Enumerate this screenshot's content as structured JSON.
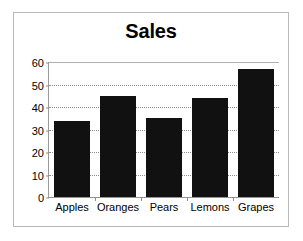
{
  "chart_data": {
    "type": "bar",
    "title": "Sales",
    "xlabel": "",
    "ylabel": "",
    "categories": [
      "Apples",
      "Oranges",
      "Pears",
      "Lemons",
      "Grapes"
    ],
    "values": [
      34,
      45,
      35,
      44,
      57
    ],
    "ylim": [
      0,
      60
    ],
    "ytick_labels": [
      "60",
      "50",
      "40",
      "30",
      "20",
      "10",
      "0"
    ],
    "ytick_values": [
      60,
      50,
      40,
      30,
      20,
      10,
      0
    ],
    "ytick_step": 10,
    "grid": true,
    "grid_axis": "y",
    "grid_style": "dotted",
    "legend": false,
    "legend_position": "none",
    "bar_color": "#111111",
    "background_color": "#ffffff",
    "frame_color": "#b9b9b9",
    "axis_color": "#9a9a9a",
    "gridline_color": "#8d8d8d",
    "title_color": "#000000",
    "tick_label_color": "#000000"
  }
}
